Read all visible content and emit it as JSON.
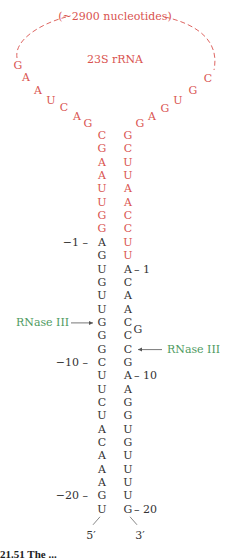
{
  "colors": {
    "rrna": "#d9534f",
    "precursor": "#333333",
    "rnase": "#4f9a62",
    "line": "#555555"
  },
  "loop": {
    "label": "(~2900 nucleotides)",
    "title": "23S rRNA",
    "left_arm": [
      "G",
      "A",
      "A",
      "U",
      "C",
      "A",
      "G"
    ],
    "right_arm": [
      "G",
      "A",
      "G",
      "U",
      "G",
      "C"
    ]
  },
  "stem": {
    "left_rrna": [
      "C",
      "G",
      "A",
      "A",
      "U",
      "U",
      "G",
      "G"
    ],
    "right_rrna": [
      "G",
      "C",
      "U",
      "U",
      "A",
      "A",
      "C",
      "C",
      "U",
      "U"
    ],
    "left_flank": [
      "A",
      "G",
      "U",
      "G",
      "U",
      "U",
      "G",
      "G",
      "G",
      "C",
      "U",
      "U",
      "C",
      "U",
      "A",
      "C",
      "A",
      "A",
      "A",
      "G",
      "U"
    ],
    "right_flank": [
      "A",
      "C",
      "A",
      "A",
      "C",
      "C",
      "C",
      "G",
      "A",
      "A",
      "G",
      "G",
      "U",
      "G",
      "U",
      "U",
      "U",
      "U",
      "G"
    ],
    "bulge": "G"
  },
  "numbering": {
    "left": [
      {
        "label": "−1",
        "index": 0
      },
      {
        "label": "−10",
        "index": 9
      },
      {
        "label": "−20",
        "index": 19
      }
    ],
    "right": [
      {
        "label": "1",
        "index": 0
      },
      {
        "label": "10",
        "index": 8
      },
      {
        "label": "20",
        "index": 18
      }
    ]
  },
  "cleavage_sites": [
    {
      "label": "RNase III",
      "side": "left",
      "index": 6
    },
    {
      "label": "RNase III",
      "side": "right",
      "index": 6
    }
  ],
  "ends": {
    "five_prime": "5′",
    "three_prime": "3′"
  },
  "caption": "21.51  The ..."
}
